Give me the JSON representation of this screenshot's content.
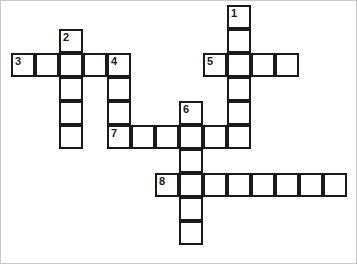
{
  "puzzle": {
    "title": "Crossword Puzzle Grid",
    "cell_size": 24,
    "origin_x": 10,
    "origin_y": 4,
    "colors": {
      "cell_fill": "#ffffff",
      "cell_border": "#1a1a1a",
      "number_text": "#1a1a1a",
      "page_background": "#ffffff",
      "frame_border": "#c9c9c9"
    },
    "entries": [
      {
        "number": "1",
        "direction": "down",
        "start_col": 9,
        "start_row": 0,
        "length": 6
      },
      {
        "number": "2",
        "direction": "down",
        "start_col": 2,
        "start_row": 1,
        "length": 5
      },
      {
        "number": "3",
        "direction": "across",
        "start_col": 0,
        "start_row": 2,
        "length": 5
      },
      {
        "number": "4",
        "direction": "down",
        "start_col": 4,
        "start_row": 2,
        "length": 4
      },
      {
        "number": "5",
        "direction": "across",
        "start_col": 8,
        "start_row": 2,
        "length": 4
      },
      {
        "number": "6",
        "direction": "down",
        "start_col": 7,
        "start_row": 4,
        "length": 6
      },
      {
        "number": "7",
        "direction": "across",
        "start_col": 4,
        "start_row": 5,
        "length": 6
      },
      {
        "number": "8",
        "direction": "across",
        "start_col": 6,
        "start_row": 7,
        "length": 8
      }
    ],
    "cells": [
      {
        "col": 9,
        "row": 0,
        "number": "1",
        "letter": ""
      },
      {
        "col": 9,
        "row": 1,
        "number": "",
        "letter": ""
      },
      {
        "col": 2,
        "row": 1,
        "number": "2",
        "letter": ""
      },
      {
        "col": 0,
        "row": 2,
        "number": "3",
        "letter": ""
      },
      {
        "col": 1,
        "row": 2,
        "number": "",
        "letter": ""
      },
      {
        "col": 2,
        "row": 2,
        "number": "",
        "letter": ""
      },
      {
        "col": 3,
        "row": 2,
        "number": "",
        "letter": ""
      },
      {
        "col": 4,
        "row": 2,
        "number": "4",
        "letter": ""
      },
      {
        "col": 8,
        "row": 2,
        "number": "5",
        "letter": ""
      },
      {
        "col": 9,
        "row": 2,
        "number": "",
        "letter": ""
      },
      {
        "col": 10,
        "row": 2,
        "number": "",
        "letter": ""
      },
      {
        "col": 11,
        "row": 2,
        "number": "",
        "letter": ""
      },
      {
        "col": 2,
        "row": 3,
        "number": "",
        "letter": ""
      },
      {
        "col": 4,
        "row": 3,
        "number": "",
        "letter": ""
      },
      {
        "col": 9,
        "row": 3,
        "number": "",
        "letter": ""
      },
      {
        "col": 2,
        "row": 4,
        "number": "",
        "letter": ""
      },
      {
        "col": 4,
        "row": 4,
        "number": "",
        "letter": ""
      },
      {
        "col": 7,
        "row": 4,
        "number": "6",
        "letter": ""
      },
      {
        "col": 9,
        "row": 4,
        "number": "",
        "letter": ""
      },
      {
        "col": 2,
        "row": 5,
        "number": "",
        "letter": ""
      },
      {
        "col": 4,
        "row": 5,
        "number": "7",
        "letter": ""
      },
      {
        "col": 5,
        "row": 5,
        "number": "",
        "letter": ""
      },
      {
        "col": 6,
        "row": 5,
        "number": "",
        "letter": ""
      },
      {
        "col": 7,
        "row": 5,
        "number": "",
        "letter": ""
      },
      {
        "col": 8,
        "row": 5,
        "number": "",
        "letter": ""
      },
      {
        "col": 9,
        "row": 5,
        "number": "",
        "letter": ""
      },
      {
        "col": 7,
        "row": 6,
        "number": "",
        "letter": ""
      },
      {
        "col": 6,
        "row": 7,
        "number": "8",
        "letter": ""
      },
      {
        "col": 7,
        "row": 7,
        "number": "",
        "letter": ""
      },
      {
        "col": 8,
        "row": 7,
        "number": "",
        "letter": ""
      },
      {
        "col": 9,
        "row": 7,
        "number": "",
        "letter": ""
      },
      {
        "col": 10,
        "row": 7,
        "number": "",
        "letter": ""
      },
      {
        "col": 11,
        "row": 7,
        "number": "",
        "letter": ""
      },
      {
        "col": 12,
        "row": 7,
        "number": "",
        "letter": ""
      },
      {
        "col": 13,
        "row": 7,
        "number": "",
        "letter": ""
      },
      {
        "col": 7,
        "row": 8,
        "number": "",
        "letter": ""
      },
      {
        "col": 7,
        "row": 9,
        "number": "",
        "letter": ""
      }
    ]
  }
}
